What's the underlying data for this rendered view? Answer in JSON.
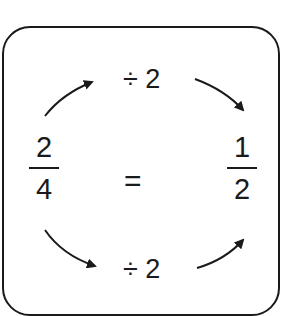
{
  "diagram": {
    "left_fraction": {
      "numerator": "2",
      "denominator": "4"
    },
    "right_fraction": {
      "numerator": "1",
      "denominator": "2"
    },
    "equals": "=",
    "top_operation": "÷ 2",
    "bottom_operation": "÷ 2",
    "colors": {
      "ink": "#1a1a1a",
      "background": "#ffffff"
    },
    "arrows": [
      {
        "name": "top-left-arrow",
        "direction": "up-right"
      },
      {
        "name": "top-right-arrow",
        "direction": "down-right"
      },
      {
        "name": "bottom-left-arrow",
        "direction": "down-right"
      },
      {
        "name": "bottom-right-arrow",
        "direction": "up-right"
      }
    ]
  }
}
